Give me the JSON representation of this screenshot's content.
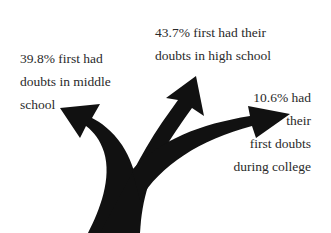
{
  "diagram": {
    "type": "branching-arrows",
    "arrow_color": "#111111",
    "branches": [
      {
        "id": "middle-school",
        "lines": [
          "39.8% first had",
          "doubts in middle",
          "school"
        ],
        "percent": "39.8%"
      },
      {
        "id": "high-school",
        "lines": [
          "43.7% first had their",
          "doubts in high school"
        ],
        "percent": "43.7%"
      },
      {
        "id": "college",
        "lines": [
          "10.6% had",
          "their",
          "first doubts",
          "during college"
        ],
        "percent": "10.6%"
      }
    ]
  }
}
